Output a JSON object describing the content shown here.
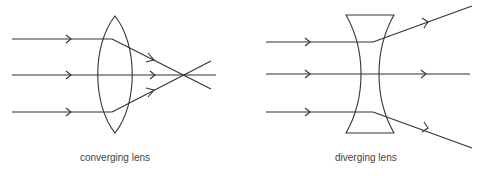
{
  "diagrams": [
    {
      "id": "converging",
      "label": "converging lens",
      "lens_type": "convex",
      "ray_count": 3,
      "behavior": "rays refract and converge to a focal point"
    },
    {
      "id": "diverging",
      "label": "diverging lens",
      "lens_type": "concave",
      "ray_count": 3,
      "behavior": "rays refract and spread apart"
    }
  ],
  "colors": {
    "stroke": "#333333",
    "label": "#444444",
    "background": "#ffffff"
  }
}
